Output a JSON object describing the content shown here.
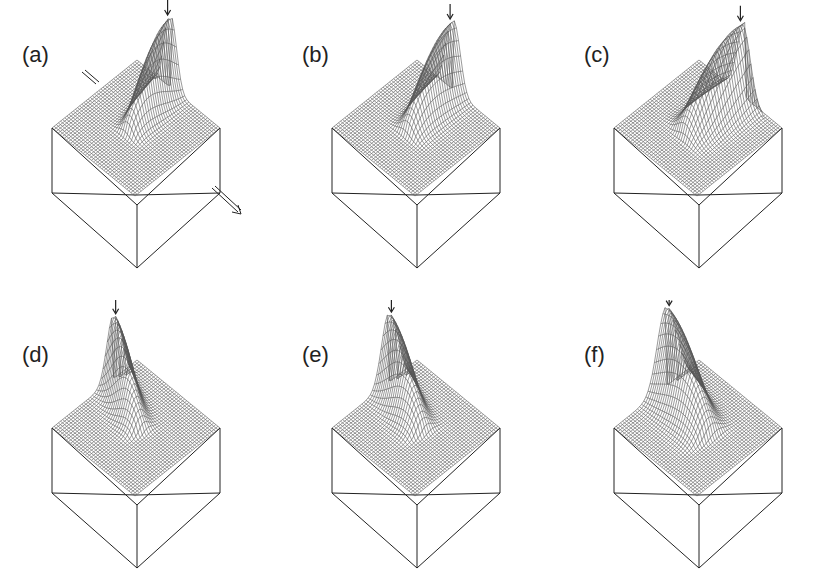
{
  "figure": {
    "panels": [
      {
        "id": "a",
        "label": "(a)",
        "x": 0,
        "y": 0,
        "has_flow_arrows": true
      },
      {
        "id": "b",
        "label": "(b)",
        "x": 280,
        "y": 0,
        "has_flow_arrows": false
      },
      {
        "id": "c",
        "label": "(c)",
        "x": 562,
        "y": 0,
        "has_flow_arrows": false
      },
      {
        "id": "d",
        "label": "(d)",
        "x": 0,
        "y": 300,
        "has_flow_arrows": false
      },
      {
        "id": "e",
        "label": "(e)",
        "x": 280,
        "y": 300,
        "has_flow_arrows": false
      },
      {
        "id": "f",
        "label": "(f)",
        "x": 562,
        "y": 300,
        "has_flow_arrows": false
      }
    ],
    "colors": {
      "line": "#222222",
      "mesh": "#555555",
      "background": "#ffffff"
    }
  }
}
